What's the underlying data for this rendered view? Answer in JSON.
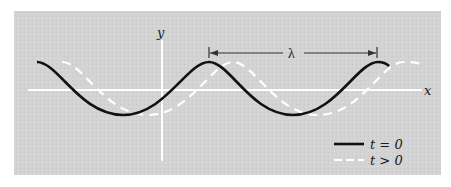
{
  "figure": {
    "type": "traveling-wave-diagram",
    "background_color": "#d4d4d4",
    "axis_color": "#ffffff",
    "axes": {
      "x_label": "x",
      "y_label": "y"
    },
    "wavelength_marker": {
      "label": "λ"
    },
    "curves": [
      {
        "name": "t = 0",
        "style": "solid",
        "color": "#111111"
      },
      {
        "name": "t > 0",
        "style": "dashed",
        "color": "#ffffff"
      }
    ],
    "legend": {
      "items": [
        {
          "label": "t = 0",
          "style": "solid"
        },
        {
          "label": "t > 0",
          "style": "dashed"
        }
      ]
    }
  }
}
